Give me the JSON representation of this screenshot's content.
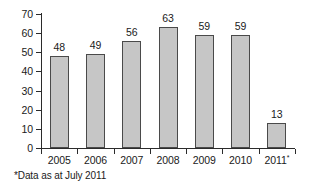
{
  "chart_data": {
    "type": "bar",
    "title": "",
    "subtitle": "",
    "xlabel": "",
    "ylabel": "",
    "categories": [
      "2005",
      "2006",
      "2007",
      "2008",
      "2009",
      "2010",
      "2011*"
    ],
    "values": [
      48,
      49,
      56,
      63,
      59,
      59,
      13
    ],
    "series": [
      {
        "name": "",
        "values": [
          48,
          49,
          56,
          63,
          59,
          59,
          13
        ]
      }
    ],
    "ylim": [
      0,
      70
    ],
    "ytick_values": [
      70,
      60,
      50,
      40,
      30,
      20,
      10,
      0
    ],
    "ytick_labels": [
      "70",
      "60",
      "50",
      "40",
      "30",
      "20",
      "10",
      "0"
    ],
    "grid": false,
    "legend": false,
    "legend_position": "none",
    "data_labels": [
      "48",
      "49",
      "56",
      "63",
      "59",
      "59",
      "13"
    ],
    "annotations": [
      "*Data as at July 2011"
    ],
    "colors": {
      "bar_fill": "#c6c6c6",
      "bar_border": "#4a4a4a",
      "axis": "#2b2b2b",
      "text": "#1a1a1a",
      "background": "#ffffff"
    }
  },
  "footnote": {
    "marker": "*",
    "text": "Data as at July 2011",
    "full": "*Data as at July 2011"
  },
  "last_category": {
    "base": "2011",
    "marker": "*"
  }
}
